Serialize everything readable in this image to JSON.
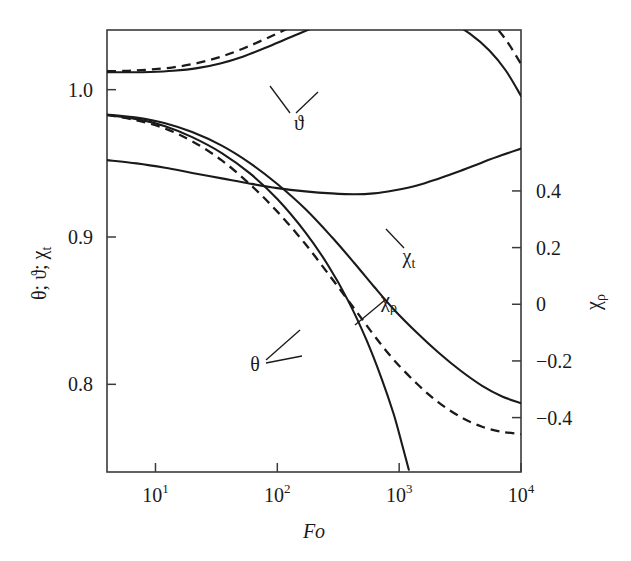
{
  "figure": {
    "background": "#ffffff",
    "ink_color": "#1a1a1a",
    "axis_color": "#3a3a3a"
  },
  "chart_data": {
    "type": "line",
    "title": "",
    "xlabel": "Fo",
    "xscale": "log",
    "xlim": [
      4,
      10000
    ],
    "x_ticks": [
      {
        "value": 10,
        "mantissa": "10",
        "exponent": "1"
      },
      {
        "value": 100,
        "mantissa": "10",
        "exponent": "2"
      },
      {
        "value": 1000,
        "mantissa": "10",
        "exponent": "3"
      },
      {
        "value": 10000,
        "mantissa": "10",
        "exponent": "4"
      }
    ],
    "left_axis": {
      "label": "θ; ϑ; χ",
      "label_sub": "t",
      "ylim": [
        0.7405,
        1.0405
      ],
      "ticks": [
        {
          "value": 1.0,
          "text": "1.0"
        },
        {
          "value": 0.9,
          "text": "0.9"
        },
        {
          "value": 0.8,
          "text": "0.8"
        }
      ]
    },
    "right_axis": {
      "label": "χ",
      "label_sub": "ρ",
      "ylim": [
        -0.592,
        0.968
      ],
      "ticks": [
        {
          "value": 0.4,
          "text": "0.4"
        },
        {
          "value": 0.2,
          "text": "0.2"
        },
        {
          "value": 0.0,
          "text": "0"
        },
        {
          "value": -0.2,
          "text": "−0.2"
        },
        {
          "value": -0.4,
          "text": "−0.4"
        }
      ]
    },
    "grid": false,
    "legend": "inline-annotations",
    "series": [
      {
        "name": "vartheta-dashed",
        "label": "ϑ",
        "style": "dashed",
        "axis": "left",
        "points": [
          [
            4,
            1.0125
          ],
          [
            6,
            1.0128
          ],
          [
            9,
            1.0136
          ],
          [
            14,
            1.0152
          ],
          [
            22,
            1.018
          ],
          [
            34,
            1.0222
          ],
          [
            52,
            1.0278
          ],
          [
            80,
            1.0345
          ],
          [
            125,
            1.042
          ],
          [
            200,
            1.0497
          ],
          [
            320,
            1.057
          ],
          [
            500,
            1.063
          ],
          [
            780,
            1.0672
          ],
          [
            1200,
            1.0692
          ],
          [
            1800,
            1.0686
          ],
          [
            2600,
            1.0652
          ],
          [
            3800,
            1.058
          ],
          [
            5500,
            1.047
          ],
          [
            7500,
            1.034
          ],
          [
            10000,
            1.0175
          ]
        ]
      },
      {
        "name": "vartheta-solid",
        "label": "ϑ",
        "style": "solid",
        "axis": "left",
        "points": [
          [
            4,
            1.0118
          ],
          [
            6,
            1.0118
          ],
          [
            9,
            1.012
          ],
          [
            14,
            1.0128
          ],
          [
            22,
            1.0146
          ],
          [
            34,
            1.0178
          ],
          [
            52,
            1.0224
          ],
          [
            80,
            1.0284
          ],
          [
            125,
            1.0352
          ],
          [
            200,
            1.0422
          ],
          [
            320,
            1.0484
          ],
          [
            500,
            1.0528
          ],
          [
            780,
            1.0548
          ],
          [
            1200,
            1.0545
          ],
          [
            1800,
            1.0516
          ],
          [
            2600,
            1.0462
          ],
          [
            3800,
            1.038
          ],
          [
            5500,
            1.0266
          ],
          [
            7500,
            1.013
          ],
          [
            10000,
            0.9958
          ]
        ]
      },
      {
        "name": "chi-t",
        "label": "χₜ",
        "style": "solid",
        "axis": "left",
        "points": [
          [
            4,
            0.9522
          ],
          [
            7,
            0.95
          ],
          [
            12,
            0.947
          ],
          [
            20,
            0.9435
          ],
          [
            35,
            0.9398
          ],
          [
            60,
            0.9362
          ],
          [
            100,
            0.9332
          ],
          [
            170,
            0.931
          ],
          [
            280,
            0.9296
          ],
          [
            430,
            0.929
          ],
          [
            620,
            0.9296
          ],
          [
            900,
            0.9316
          ],
          [
            1400,
            0.935
          ],
          [
            2100,
            0.9396
          ],
          [
            3200,
            0.945
          ],
          [
            4800,
            0.9506
          ],
          [
            7000,
            0.9556
          ],
          [
            10000,
            0.96
          ]
        ]
      },
      {
        "name": "theta-solid",
        "label": "θ",
        "style": "solid",
        "axis": "left",
        "points": [
          [
            4,
            0.9832
          ],
          [
            7,
            0.981
          ],
          [
            12,
            0.9772
          ],
          [
            20,
            0.9712
          ],
          [
            35,
            0.962
          ],
          [
            60,
            0.95
          ],
          [
            100,
            0.936
          ],
          [
            170,
            0.919
          ],
          [
            280,
            0.9
          ],
          [
            430,
            0.8822
          ],
          [
            620,
            0.8664
          ],
          [
            900,
            0.851
          ],
          [
            1400,
            0.835
          ],
          [
            2100,
            0.8216
          ],
          [
            3200,
            0.8092
          ],
          [
            4800,
            0.799
          ],
          [
            7000,
            0.7918
          ],
          [
            10000,
            0.7872
          ]
        ]
      },
      {
        "name": "theta-dashed",
        "label": "θ",
        "style": "dashed",
        "axis": "left",
        "points": [
          [
            4,
            0.9828
          ],
          [
            7,
            0.9792
          ],
          [
            12,
            0.9736
          ],
          [
            20,
            0.965
          ],
          [
            35,
            0.952
          ],
          [
            60,
            0.9356
          ],
          [
            100,
            0.9172
          ],
          [
            170,
            0.8952
          ],
          [
            280,
            0.8718
          ],
          [
            430,
            0.8512
          ],
          [
            620,
            0.8334
          ],
          [
            900,
            0.8168
          ],
          [
            1400,
            0.8004
          ],
          [
            2100,
            0.7878
          ],
          [
            3200,
            0.7778
          ],
          [
            4800,
            0.7712
          ],
          [
            7000,
            0.7678
          ],
          [
            10000,
            0.7662
          ]
        ]
      },
      {
        "name": "chi-rho",
        "label": "χᵨ",
        "style": "solid",
        "axis": "left",
        "points": [
          [
            4,
            0.9828
          ],
          [
            7,
            0.98
          ],
          [
            12,
            0.9752
          ],
          [
            20,
            0.9678
          ],
          [
            35,
            0.957
          ],
          [
            60,
            0.943
          ],
          [
            100,
            0.9258
          ],
          [
            170,
            0.9032
          ],
          [
            260,
            0.881
          ],
          [
            380,
            0.857
          ],
          [
            540,
            0.83
          ],
          [
            720,
            0.8036
          ],
          [
            900,
            0.78
          ],
          [
            1050,
            0.76
          ],
          [
            1200,
            0.742
          ]
        ]
      }
    ],
    "annotations": [
      {
        "name": "vartheta-callout",
        "text": "ϑ",
        "text_sub": "",
        "text_x": 299,
        "text_y": 130,
        "leaders": [
          [
            [
              290,
              113
            ],
            [
              270,
              86
            ]
          ],
          [
            [
              296,
              113
            ],
            [
              318,
              92
            ]
          ]
        ]
      },
      {
        "name": "chi-t-callout",
        "text": "χ",
        "text_sub": "t",
        "text_x": 409,
        "text_y": 263,
        "leaders": [
          [
            [
              404,
              248
            ],
            [
              386,
              229
            ]
          ]
        ]
      },
      {
        "name": "chi-rho-callout",
        "text": "χ",
        "text_sub": "ρ",
        "text_x": 389,
        "text_y": 307,
        "leaders": [
          [
            [
              385,
              300
            ],
            [
              355,
              325
            ]
          ]
        ]
      },
      {
        "name": "theta-callout",
        "text": "θ",
        "text_sub": "",
        "text_x": 255,
        "text_y": 371,
        "leaders": [
          [
            [
              266,
              360
            ],
            [
              300,
              330
            ]
          ],
          [
            [
              266,
              363
            ],
            [
              302,
              356
            ]
          ]
        ]
      }
    ]
  },
  "geometry": {
    "plot_left": 107,
    "plot_right": 521,
    "plot_top": 30,
    "plot_bottom": 472
  }
}
